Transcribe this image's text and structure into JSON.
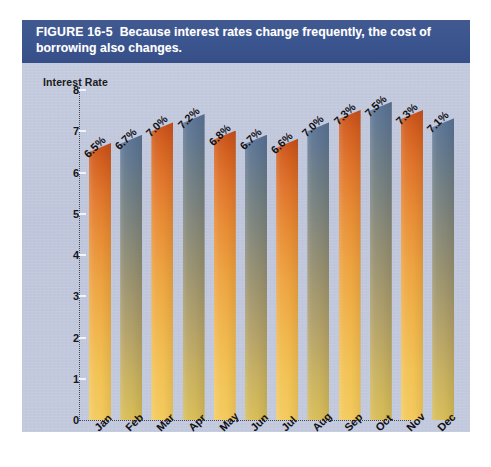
{
  "figure": {
    "label": "FIGURE 16-5",
    "caption": "Because interest rates change frequently, the cost of borrowing also changes."
  },
  "colors": {
    "banner_background": "#3b5694",
    "banner_text": "#ffffff",
    "panel_background": "#c2c9dd",
    "bar_warm_top": "#c8501c",
    "bar_warm_bottom": "#f3ca5d",
    "bar_cool_top": "#5a7294",
    "bar_cool_bottom": "#d8bd57",
    "axis": "#45484f",
    "tick_mark": "#f2f4fa",
    "text": "#111115"
  },
  "chart_data": {
    "type": "bar",
    "title": "Because interest rates change frequently, the cost of borrowing also changes.",
    "xlabel": "",
    "ylabel": "Interest Rate",
    "categories": [
      "Jan",
      "Feb",
      "Mar",
      "Apr",
      "May",
      "Jun",
      "Jul",
      "Aug",
      "Sep",
      "Oct",
      "Nov",
      "Dec"
    ],
    "values": [
      6.5,
      6.7,
      7.0,
      7.2,
      6.8,
      6.7,
      6.6,
      7.0,
      7.3,
      7.5,
      7.3,
      7.1
    ],
    "data_labels": [
      "6.5%",
      "6.7%",
      "7.0%",
      "7.2%",
      "6.8%",
      "6.7%",
      "6.6%",
      "7.0%",
      "7.3%",
      "7.5%",
      "7.3%",
      "7.1%"
    ],
    "ylim": [
      0,
      8
    ],
    "yticks": [
      0,
      1,
      2,
      3,
      4,
      5,
      6,
      7,
      8
    ],
    "ytick_labels": [
      "0",
      "1",
      "2",
      "3",
      "4",
      "5",
      "6",
      "7",
      "8"
    ],
    "grid": false,
    "legend": false,
    "bar_color_cycle": [
      "warm",
      "cool"
    ]
  }
}
